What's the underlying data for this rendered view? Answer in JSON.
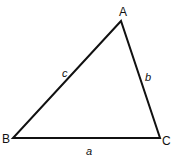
{
  "diagram": {
    "type": "triangle",
    "vertices": [
      {
        "id": "A",
        "label": "A",
        "x": 121,
        "y": 21,
        "label_x": 119,
        "label_y": 16
      },
      {
        "id": "B",
        "label": "B",
        "x": 13,
        "y": 138,
        "label_x": 2,
        "label_y": 143
      },
      {
        "id": "C",
        "label": "C",
        "x": 160,
        "y": 138,
        "label_x": 162,
        "label_y": 145
      }
    ],
    "sides": [
      {
        "id": "a",
        "label": "a",
        "from": "B",
        "to": "C",
        "label_x": 86,
        "label_y": 155
      },
      {
        "id": "b",
        "label": "b",
        "from": "A",
        "to": "C",
        "label_x": 145,
        "label_y": 81
      },
      {
        "id": "c",
        "label": "c",
        "from": "A",
        "to": "B",
        "label_x": 62,
        "label_y": 77
      }
    ],
    "stroke_color": "#111111"
  }
}
